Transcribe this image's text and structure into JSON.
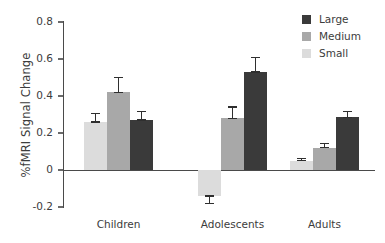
{
  "chart_data": {
    "type": "bar",
    "title": "",
    "xlabel": "",
    "ylabel": "%fMRI Signal Change",
    "categories": [
      "Children",
      "Adolescents",
      "Adults"
    ],
    "ylim": [
      -0.2,
      0.8
    ],
    "yticks": [
      "0.8",
      "0.6",
      "0.4",
      "0.2",
      "0",
      "-0.2"
    ],
    "ytick_values": [
      0.8,
      0.6,
      0.4,
      0.2,
      0,
      -0.2
    ],
    "grid": false,
    "legend_position": "top-right",
    "bar_order_in_group": [
      "Small",
      "Medium",
      "Large"
    ],
    "series": [
      {
        "name": "Small",
        "color": "#dcdcdc",
        "values": [
          0.26,
          -0.14,
          0.05
        ],
        "errors": [
          0.045,
          0.04,
          0.012
        ]
      },
      {
        "name": "Medium",
        "color": "#a8a8a8",
        "values": [
          0.42,
          0.28,
          0.12
        ],
        "errors": [
          0.08,
          0.06,
          0.025
        ]
      },
      {
        "name": "Large",
        "color": "#3a3a3a",
        "values": [
          0.27,
          0.53,
          0.285
        ],
        "errors": [
          0.045,
          0.08,
          0.032
        ]
      }
    ]
  },
  "legend": {
    "items": [
      {
        "label": "Large",
        "color": "#3a3a3a"
      },
      {
        "label": "Medium",
        "color": "#a8a8a8"
      },
      {
        "label": "Small",
        "color": "#dcdcdc"
      }
    ]
  },
  "axis": {
    "y_title": "%fMRI Signal Change"
  }
}
